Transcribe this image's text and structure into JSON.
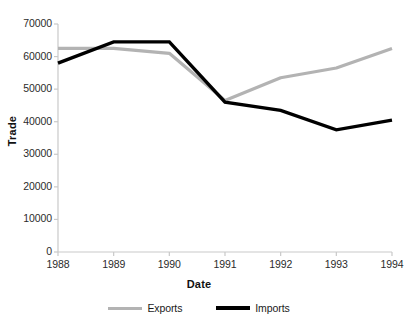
{
  "chart_data": {
    "type": "line",
    "title": "",
    "xlabel": "Date",
    "ylabel": "Trade",
    "x": [
      "1988",
      "1989",
      "1990",
      "1991",
      "1992",
      "1993",
      "1994"
    ],
    "categories": [
      "1988",
      "1989",
      "1990",
      "1991",
      "1992",
      "1993",
      "1994"
    ],
    "series": [
      {
        "name": "Exports",
        "color": "#b3b3b3",
        "values": [
          62500,
          62500,
          61000,
          46500,
          53500,
          56500,
          62500
        ]
      },
      {
        "name": "Imports",
        "color": "#000000",
        "values": [
          58000,
          64500,
          64500,
          46000,
          43500,
          37500,
          40500
        ]
      }
    ],
    "ylim": [
      0,
      70000
    ],
    "yticks": [
      0,
      10000,
      20000,
      30000,
      40000,
      50000,
      60000,
      70000
    ],
    "ytick_labels": [
      "0",
      "10000",
      "20000",
      "30000",
      "40000",
      "50000",
      "60000",
      "70000"
    ],
    "xtick_labels": [
      "1988",
      "1989",
      "1990",
      "1991",
      "1992",
      "1993",
      "1994"
    ],
    "grid": false,
    "legend_position": "bottom",
    "legend_entries": [
      "Exports",
      "Imports"
    ]
  },
  "axes": {
    "x_title": "Date",
    "y_title": "Trade"
  },
  "legend": {
    "exports_label": "Exports",
    "imports_label": "Imports"
  },
  "colors": {
    "exports": "#b3b3b3",
    "imports": "#000000",
    "axis": "#c8c8c8",
    "text": "#2b2b2b"
  }
}
